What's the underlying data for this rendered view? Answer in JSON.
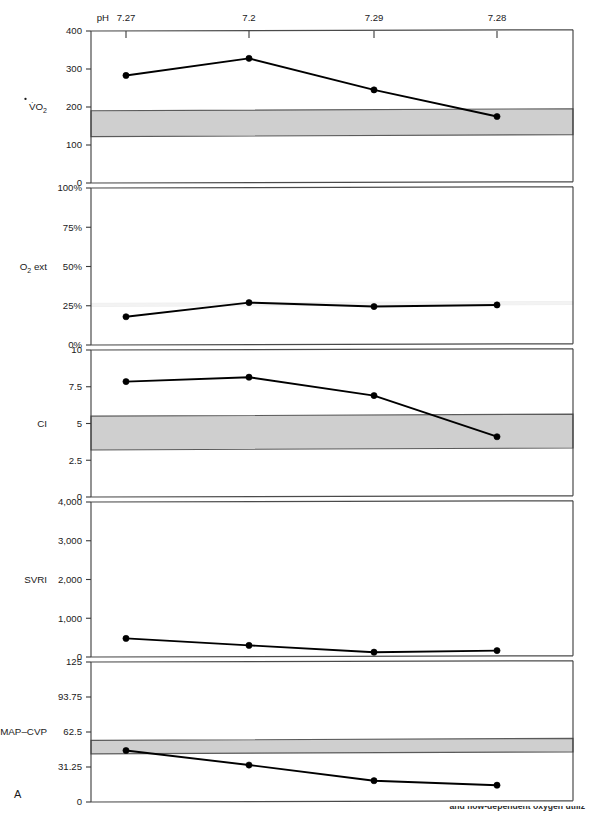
{
  "figure": {
    "panel_letter": "A",
    "x_axis_title": "pH",
    "x_tick_labels": [
      "7.27",
      "7.2",
      "7.29",
      "7.28"
    ],
    "caption_fragment": "and flow-dependent oxygen utiliz"
  },
  "colors": {
    "normal_band": "#cfcfcf",
    "faint_band": "#f3f3f3",
    "line": "#000000",
    "axis": "#3a3a3a"
  },
  "chart_data": {
    "type": "line",
    "title": "",
    "subtitle": "",
    "xlabel": "pH",
    "grid": false,
    "legend": "none",
    "x": [
      "7.27",
      "7.2",
      "7.29",
      "7.28"
    ],
    "panels": [
      {
        "name": "vo2",
        "row_label": "V̇O",
        "row_label_sub": "2",
        "ylabel": "V̇O2",
        "ylim": [
          0,
          400
        ],
        "yticks": [
          0,
          100,
          200,
          300,
          400
        ],
        "ytick_labels": [
          "0",
          "100",
          "200",
          "300",
          "400"
        ],
        "values": [
          283,
          328,
          245,
          175
        ],
        "normal_band": {
          "low": 122,
          "high": 190,
          "style": "gray"
        }
      },
      {
        "name": "o2_ext",
        "row_label": "O",
        "row_label_sub": "2",
        "row_label_tail": " ext",
        "ylabel": "O2 ext",
        "ylim": [
          0,
          100
        ],
        "yticks": [
          0,
          25,
          50,
          75,
          100
        ],
        "ytick_labels": [
          "0%",
          "25%",
          "50%",
          "75%",
          "100%"
        ],
        "values": [
          18,
          27,
          24.5,
          25.5
        ],
        "normal_band": {
          "low": 24.5,
          "high": 26.5,
          "style": "faint"
        }
      },
      {
        "name": "ci",
        "row_label": "CI",
        "ylabel": "CI",
        "ylim": [
          0,
          10
        ],
        "yticks": [
          0,
          2.5,
          5,
          7.5,
          10
        ],
        "ytick_labels": [
          "0",
          "2.5",
          "5",
          "7.5",
          "10"
        ],
        "values": [
          7.85,
          8.15,
          6.9,
          4.1
        ],
        "normal_band": {
          "low": 3.2,
          "high": 5.5,
          "style": "gray"
        }
      },
      {
        "name": "svri",
        "row_label": "SVRI",
        "ylabel": "SVRI",
        "ylim": [
          0,
          4000
        ],
        "yticks": [
          0,
          1000,
          2000,
          3000,
          4000
        ],
        "ytick_labels": [
          "0",
          "1,000",
          "2,000",
          "3,000",
          "4,000"
        ],
        "values": [
          480,
          300,
          125,
          165
        ],
        "normal_band": null
      },
      {
        "name": "map_cvp",
        "row_label": "MAP–CVP",
        "ylabel": "MAP-CVP",
        "ylim": [
          0,
          125
        ],
        "yticks": [
          0,
          31.25,
          62.5,
          93.75,
          125
        ],
        "ytick_labels": [
          "0",
          "31.25",
          "62.5",
          "93.75",
          "125"
        ],
        "values": [
          46,
          33,
          19,
          15
        ],
        "normal_band": {
          "low": 43,
          "high": 55,
          "style": "gray"
        }
      }
    ]
  },
  "geometry": {
    "plot_left": 91,
    "plot_right": 573,
    "tick_x": [
      126,
      249,
      374,
      497
    ],
    "panel_tops": [
      31,
      188,
      350,
      502,
      662
    ],
    "panel_bottoms": [
      183,
      345,
      497,
      657,
      802
    ]
  }
}
